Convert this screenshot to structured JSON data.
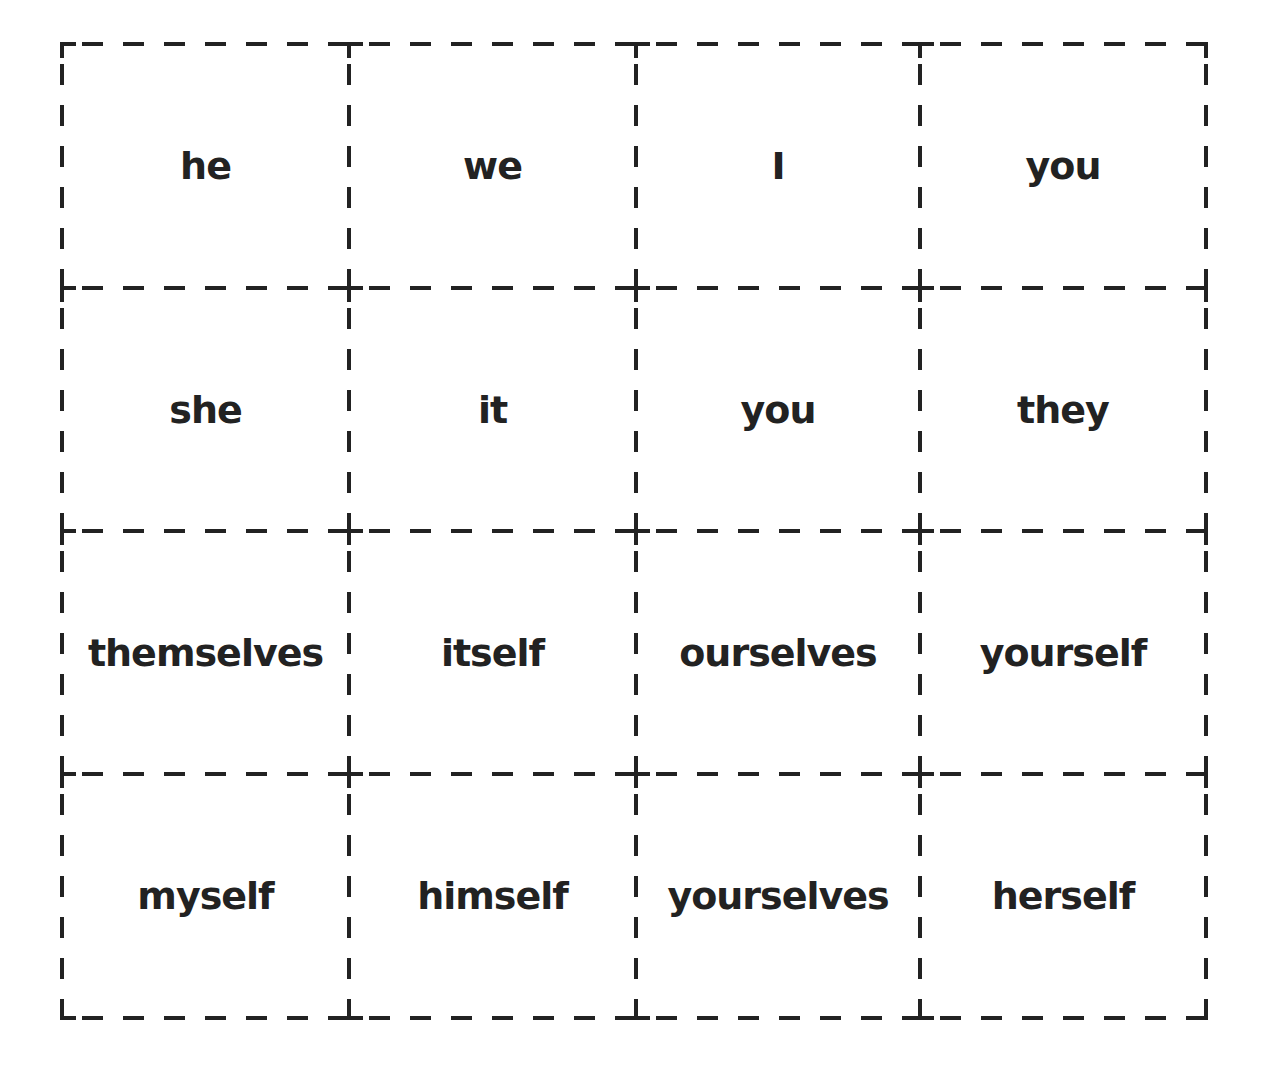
{
  "worksheet": {
    "title": "Pronoun cards",
    "grid": {
      "rows": 4,
      "columns": 4,
      "line_color": "#222222",
      "text_color": "#222222",
      "col_edges": [
        62,
        349,
        636,
        920,
        1206
      ],
      "row_edges": [
        44,
        288,
        531,
        774,
        1018
      ]
    },
    "cards": [
      {
        "row": 0,
        "col": 0,
        "text": "he"
      },
      {
        "row": 0,
        "col": 1,
        "text": "we"
      },
      {
        "row": 0,
        "col": 2,
        "text": "I"
      },
      {
        "row": 0,
        "col": 3,
        "text": "you"
      },
      {
        "row": 1,
        "col": 0,
        "text": "she"
      },
      {
        "row": 1,
        "col": 1,
        "text": "it"
      },
      {
        "row": 1,
        "col": 2,
        "text": "you"
      },
      {
        "row": 1,
        "col": 3,
        "text": "they"
      },
      {
        "row": 2,
        "col": 0,
        "text": "themselves"
      },
      {
        "row": 2,
        "col": 1,
        "text": "itself"
      },
      {
        "row": 2,
        "col": 2,
        "text": "ourselves"
      },
      {
        "row": 2,
        "col": 3,
        "text": "yourself"
      },
      {
        "row": 3,
        "col": 0,
        "text": "myself"
      },
      {
        "row": 3,
        "col": 1,
        "text": "himself"
      },
      {
        "row": 3,
        "col": 2,
        "text": "yourselves"
      },
      {
        "row": 3,
        "col": 3,
        "text": "herself"
      }
    ]
  }
}
